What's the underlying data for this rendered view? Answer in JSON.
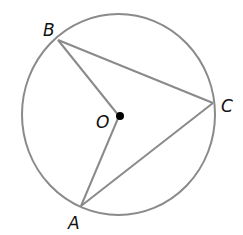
{
  "diagram": {
    "type": "circle-geometry",
    "colors": {
      "stroke": "#8a8a8a",
      "text": "#111111",
      "center_dot": "#000000"
    },
    "circle": {
      "cx": 118.5,
      "cy": 114.5,
      "rx": 96.5,
      "ry": 100.5
    },
    "points": {
      "B": {
        "label": "B",
        "x": 58,
        "y": 40
      },
      "C": {
        "label": "C",
        "x": 213,
        "y": 103
      },
      "A": {
        "label": "A",
        "x": 81,
        "y": 206
      },
      "O": {
        "label": "O",
        "x": 119,
        "y": 116
      }
    },
    "segments": [
      "BC",
      "CA",
      "BO",
      "OA"
    ]
  }
}
